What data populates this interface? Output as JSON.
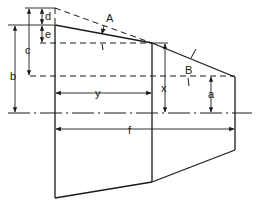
{
  "diagram": {
    "labels": {
      "angle_a": "A",
      "angle_b": "B",
      "dim_a": "a",
      "dim_b": "b",
      "dim_c": "c",
      "dim_d": "d",
      "dim_e": "e",
      "dim_f": "f",
      "dim_x": "x",
      "dim_y": "y"
    },
    "colors": {
      "stroke": "#1a1a1a",
      "background": "#ffffff"
    }
  }
}
